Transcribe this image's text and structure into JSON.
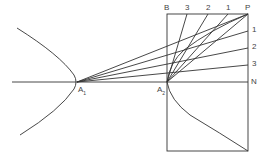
{
  "diagram": {
    "type": "hyperbola-construction",
    "stroke_color": "#333333",
    "label_color": "#444444",
    "labels": {
      "A1": {
        "main": "A",
        "sub": "1"
      },
      "A2": {
        "main": "A",
        "sub": "2"
      },
      "B": "B",
      "P": "P",
      "N": "N",
      "top_divisions": [
        "3",
        "2",
        "1"
      ],
      "side_divisions": [
        "1",
        "2",
        "3"
      ]
    },
    "points": {
      "A1": [
        77,
        82
      ],
      "A2": [
        167,
        82
      ],
      "B": [
        167,
        14
      ],
      "P": [
        248,
        14
      ],
      "N": [
        248,
        82
      ],
      "rect_bottom_left": [
        167,
        151
      ],
      "rect_bottom_right": [
        248,
        151
      ]
    },
    "top_division_x": [
      187,
      208,
      228
    ],
    "side_division_y": [
      31,
      48,
      65
    ],
    "axis": {
      "x_start": 12,
      "x_end": 248,
      "y": 82
    }
  }
}
